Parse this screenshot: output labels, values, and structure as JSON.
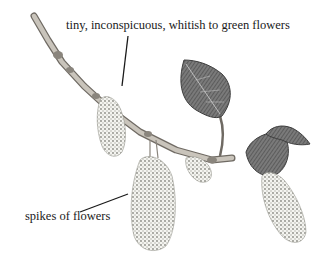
{
  "illustration": {
    "subject": "flowering twig with drooping catkins and young leaves",
    "labels": [
      {
        "text": "tiny, inconspicuous, whitish to green flowers",
        "pointer_to": "small catkin on upper branch"
      },
      {
        "text": "spikes of flowers",
        "pointer_to": "large hanging catkin"
      }
    ],
    "colors": {
      "background": "#ffffff",
      "ink": "#1a1a1a",
      "branch": "#a9a39a",
      "branch_shade": "#6f6a63",
      "leaf": "#6b6b6b",
      "leaf_dark": "#3e3e3e",
      "catkin": "#b8b8b0"
    }
  }
}
